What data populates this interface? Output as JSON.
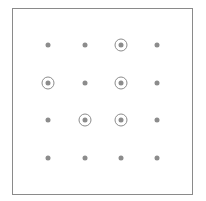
{
  "grid": {
    "rows": 4,
    "cols": 4,
    "col_x": [
      48,
      85,
      121,
      157
    ],
    "row_y": [
      45,
      83,
      120,
      158
    ],
    "dot_color": "#8c8c8c",
    "circled": [
      [
        0,
        2
      ],
      [
        1,
        0
      ],
      [
        1,
        2
      ],
      [
        2,
        1
      ],
      [
        2,
        2
      ]
    ]
  }
}
